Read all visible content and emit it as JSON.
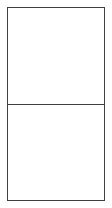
{
  "colors": {
    "background": "#ffffff",
    "border": "#3f3f3f"
  },
  "box": {
    "cells": [
      {
        "label": ""
      },
      {
        "label": ""
      }
    ]
  }
}
